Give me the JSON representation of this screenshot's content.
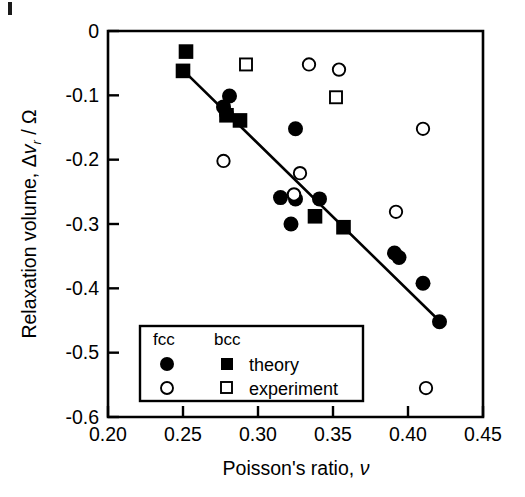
{
  "chart_data": {
    "type": "scatter",
    "title": "",
    "xlabel": "Poisson's ratio, ν",
    "ylabel": "Relaxation volume, Δv_r / Ω",
    "xlim": [
      0.2,
      0.45
    ],
    "ylim": [
      -0.6,
      0.0
    ],
    "xticks": [
      "0.20",
      "0.25",
      "0.30",
      "0.35",
      "0.40",
      "0.45"
    ],
    "xtick_values": [
      0.2,
      0.25,
      0.3,
      0.35,
      0.4,
      0.45
    ],
    "yticks": [
      "0",
      "-0.1",
      "-0.2",
      "-0.3",
      "-0.4",
      "-0.5",
      "-0.6"
    ],
    "ytick_values": [
      0.0,
      -0.1,
      -0.2,
      -0.3,
      -0.4,
      -0.5,
      -0.6
    ],
    "grid": false,
    "legend_position": "lower-left-inside",
    "series": [
      {
        "name": "fcc theory",
        "marker": "filled-circle",
        "lattice": "fcc",
        "kind": "theory",
        "points": [
          [
            0.281,
            -0.101
          ],
          [
            0.277,
            -0.118
          ],
          [
            0.279,
            -0.129
          ],
          [
            0.325,
            -0.152
          ],
          [
            0.315,
            -0.259
          ],
          [
            0.325,
            -0.261
          ],
          [
            0.341,
            -0.261
          ],
          [
            0.322,
            -0.3
          ],
          [
            0.391,
            -0.345
          ],
          [
            0.394,
            -0.352
          ],
          [
            0.41,
            -0.392
          ],
          [
            0.421,
            -0.452
          ]
        ]
      },
      {
        "name": "bcc theory",
        "marker": "filled-square",
        "lattice": "bcc",
        "kind": "theory",
        "points": [
          [
            0.252,
            -0.032
          ],
          [
            0.25,
            -0.062
          ],
          [
            0.279,
            -0.131
          ],
          [
            0.288,
            -0.139
          ],
          [
            0.338,
            -0.288
          ],
          [
            0.357,
            -0.305
          ]
        ]
      },
      {
        "name": "fcc experiment",
        "marker": "open-circle",
        "lattice": "fcc",
        "kind": "experiment",
        "points": [
          [
            0.334,
            -0.052
          ],
          [
            0.354,
            -0.06
          ],
          [
            0.277,
            -0.202
          ],
          [
            0.41,
            -0.152
          ],
          [
            0.328,
            -0.221
          ],
          [
            0.324,
            -0.254
          ],
          [
            0.392,
            -0.281
          ],
          [
            0.412,
            -0.555
          ]
        ]
      },
      {
        "name": "bcc experiment",
        "marker": "open-square",
        "lattice": "bcc",
        "kind": "experiment",
        "points": [
          [
            0.292,
            -0.052
          ],
          [
            0.352,
            -0.103
          ]
        ]
      }
    ],
    "trendline": {
      "name": "fit line",
      "x": [
        0.2505,
        0.4215
      ],
      "y": [
        -0.062,
        -0.452
      ]
    },
    "annotations": []
  },
  "legend": {
    "col_fcc": "fcc",
    "col_bcc": "bcc",
    "row_theory": "theory",
    "row_experiment": "experiment"
  },
  "axes": {
    "x_title_main": "Poisson's ratio, ",
    "x_title_symbol": "ν",
    "y_title_main": "Relaxation volume, ",
    "y_title_delta": "Δ",
    "y_title_v": "v",
    "y_title_sub": "r",
    "y_title_tail": " / Ω"
  }
}
